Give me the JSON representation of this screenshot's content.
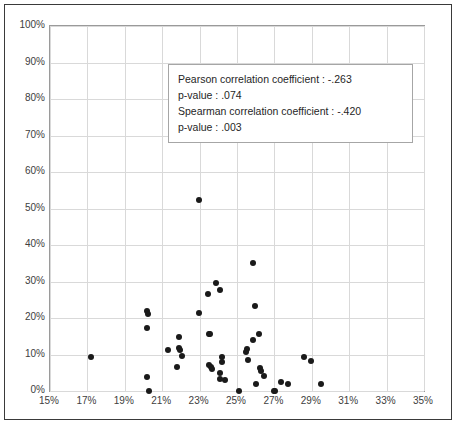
{
  "chart_data": {
    "type": "scatter",
    "title": "",
    "xlabel": "",
    "ylabel": "",
    "xlim": [
      15,
      35
    ],
    "ylim": [
      0,
      100
    ],
    "grid": true,
    "legend": null,
    "x_tick_labels": [
      "15%",
      "17%",
      "19%",
      "21%",
      "23%",
      "25%",
      "27%",
      "29%",
      "31%",
      "33%",
      "35%"
    ],
    "x_tick_values": [
      15,
      17,
      19,
      21,
      23,
      25,
      27,
      29,
      31,
      33,
      35
    ],
    "y_tick_labels": [
      "0%",
      "10%",
      "20%",
      "30%",
      "40%",
      "50%",
      "60%",
      "70%",
      "80%",
      "90%",
      "100%"
    ],
    "y_tick_values": [
      0,
      10,
      20,
      30,
      40,
      50,
      60,
      70,
      80,
      90,
      100
    ],
    "point_color": "#1a1a1a",
    "series": [
      {
        "name": "observations",
        "points": [
          [
            17.2,
            9.3
          ],
          [
            20.2,
            21.8
          ],
          [
            20.25,
            21.0
          ],
          [
            20.2,
            17.3
          ],
          [
            20.2,
            3.9
          ],
          [
            20.3,
            0.0
          ],
          [
            21.3,
            11.1
          ],
          [
            21.9,
            14.9
          ],
          [
            21.9,
            11.8
          ],
          [
            21.95,
            11.3
          ],
          [
            22.05,
            9.6
          ],
          [
            21.8,
            6.6
          ],
          [
            22.95,
            52.3
          ],
          [
            22.95,
            21.3
          ],
          [
            23.45,
            26.7
          ],
          [
            23.5,
            15.7
          ],
          [
            23.55,
            15.5
          ],
          [
            23.5,
            7.0
          ],
          [
            23.6,
            6.7
          ],
          [
            23.65,
            5.9
          ],
          [
            23.9,
            29.7
          ],
          [
            24.1,
            27.6
          ],
          [
            24.2,
            9.4
          ],
          [
            24.2,
            7.9
          ],
          [
            24.1,
            4.9
          ],
          [
            24.1,
            3.4
          ],
          [
            24.35,
            2.9
          ],
          [
            25.1,
            0.0
          ],
          [
            25.55,
            11.5
          ],
          [
            25.5,
            10.7
          ],
          [
            25.6,
            8.4
          ],
          [
            25.85,
            35.1
          ],
          [
            25.95,
            23.3
          ],
          [
            25.85,
            14.1
          ],
          [
            26.15,
            15.6
          ],
          [
            26.0,
            2.0
          ],
          [
            26.25,
            6.3
          ],
          [
            26.3,
            5.5
          ],
          [
            26.45,
            4.1
          ],
          [
            27.0,
            0.0
          ],
          [
            27.05,
            0.0
          ],
          [
            27.35,
            2.6
          ],
          [
            27.75,
            1.9
          ],
          [
            28.6,
            9.4
          ],
          [
            28.95,
            8.2
          ],
          [
            29.5,
            2.0
          ]
        ]
      }
    ],
    "annotations": [
      "Pearson correlation coefficient :  -.263",
      "p-value :  .074",
      "Spearman correlation coefficient :  -.420",
      "p-value :  .003"
    ]
  },
  "stats_box": {
    "line1": "Pearson correlation coefficient :  -.263",
    "line2": "p-value :  .074",
    "line3": "Spearman correlation coefficient :  -.420",
    "line4": "p-value :  .003"
  }
}
